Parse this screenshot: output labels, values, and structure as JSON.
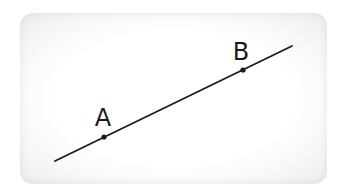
{
  "diagram": {
    "line": {
      "color": "#1a1a1a"
    },
    "points": [
      {
        "label": "A"
      },
      {
        "label": "B"
      }
    ],
    "panel_color": "#ffffff",
    "border_shade": "#ececec"
  }
}
